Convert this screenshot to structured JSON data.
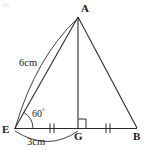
{
  "figure": {
    "kind": "geometry-diagram",
    "stroke_color": "#2b2b2b",
    "text_color": "#1a1a1a",
    "background_color": "#ffffff",
    "width": 149,
    "height": 157
  },
  "vertices": [
    {
      "id": "A",
      "label": "A",
      "x": 78,
      "y": 16,
      "label_x": 81,
      "label_y": 3
    },
    {
      "id": "E",
      "label": "E",
      "x": 14,
      "y": 130,
      "label_x": 2,
      "label_y": 124
    },
    {
      "id": "G",
      "label": "G",
      "x": 78,
      "y": 128,
      "label_x": 74,
      "label_y": 131
    },
    {
      "id": "B",
      "label": "B",
      "x": 137,
      "y": 128,
      "label_x": 133,
      "label_y": 131
    }
  ],
  "segments": [
    {
      "name": "segment-EA",
      "from": "E",
      "to": "A"
    },
    {
      "name": "segment-AB",
      "from": "A",
      "to": "B"
    },
    {
      "name": "segment-AG",
      "from": "A",
      "to": "G"
    },
    {
      "name": "segment-EB",
      "from": "E",
      "to": "B"
    }
  ],
  "measurements": [
    {
      "name": "length-EA",
      "text": "6cm",
      "x": 19,
      "y": 58,
      "applies_to": "segment-EA"
    },
    {
      "name": "length-EG",
      "text": "3cm",
      "x": 27,
      "y": 137,
      "applies_to": "segment-EG"
    }
  ],
  "angles": [
    {
      "name": "angle-AEB",
      "text": "60",
      "degree_symbol": "°",
      "at": "E",
      "x": 32,
      "y": 108
    }
  ],
  "markers": [
    {
      "name": "right-angle-marker-G",
      "type": "right-angle",
      "x": 78,
      "y": 128
    },
    {
      "name": "tick-marks-EG",
      "type": "double-tick",
      "x": 52,
      "y": 128,
      "count": 2
    },
    {
      "name": "tick-marks-GB",
      "type": "double-tick",
      "x": 108,
      "y": 128,
      "count": 2
    }
  ],
  "arcs": [
    {
      "name": "measure-arc-6cm",
      "label": "6cm",
      "from": "A",
      "to": "E"
    },
    {
      "name": "measure-arc-3cm",
      "label": "3cm",
      "from": "E",
      "to": "G"
    }
  ],
  "artifact": {
    "name": "scan-artifact-top-left",
    "text": "10."
  }
}
